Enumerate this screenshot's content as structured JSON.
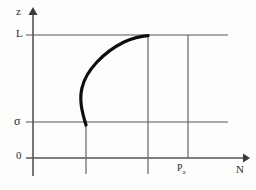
{
  "figure": {
    "title": "",
    "type": "line-plot-schematic",
    "axes": {
      "y": {
        "name": "z",
        "label": "z",
        "arrow": true
      },
      "x": {
        "name": "N",
        "label": "N",
        "arrow": true
      }
    },
    "y_ticks": [
      {
        "label": "L",
        "value": "L",
        "y_px": 35
      },
      {
        "label": "σ",
        "value": "sigma",
        "y_px": 122
      },
      {
        "label": "0",
        "value": "0",
        "y_px": 158
      }
    ],
    "x_ticks": [
      {
        "label": "P",
        "sub": "a",
        "value": "Pa",
        "x_px": 188
      }
    ],
    "gridlines": {
      "horizontal": [
        "L",
        "σ",
        "0"
      ],
      "vertical": [
        "x1",
        "x2",
        "Pa"
      ]
    },
    "curve": {
      "name": "profile-curve",
      "description": "thick curve bulging leftward from sigma level up to L level",
      "color": "#111111",
      "start": {
        "x_px": 86,
        "y_px": 124
      },
      "end": {
        "x_px": 148,
        "y_px": 36
      }
    },
    "colors": {
      "ink": "#2b2b2b",
      "grid": "#8a8a8a",
      "curve": "#111111",
      "background": "#fdfdfc"
    }
  }
}
